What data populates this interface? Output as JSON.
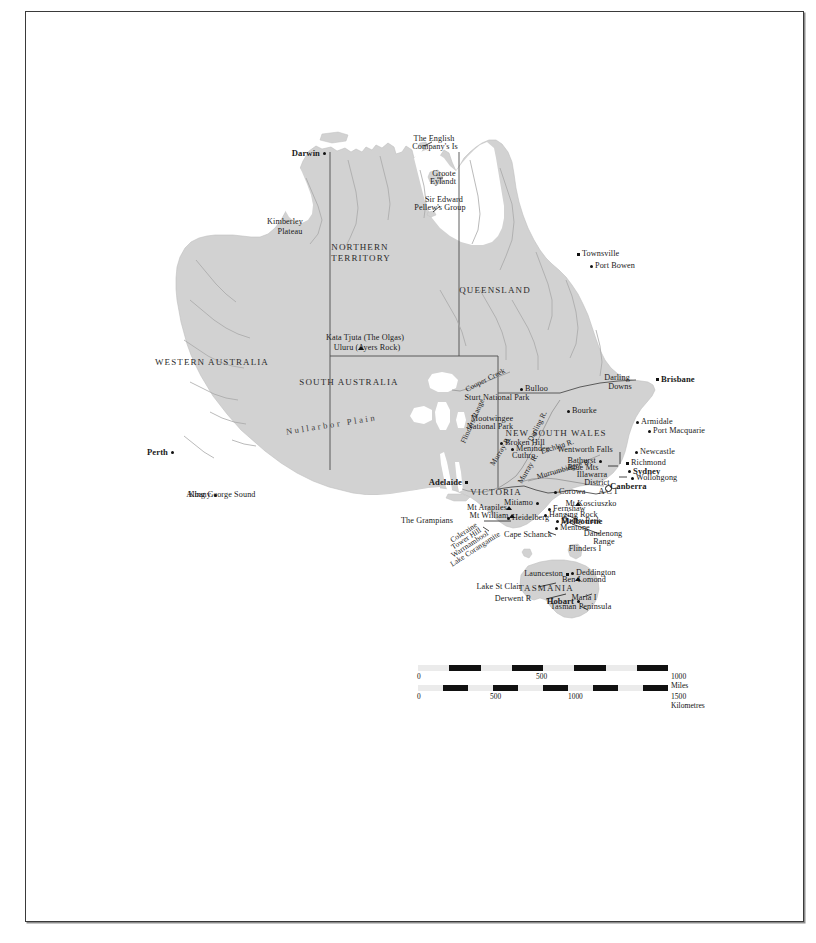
{
  "map": {
    "title": "Australia",
    "land_color": "#d2d2d2",
    "border_color": "#8a8a8a",
    "river_color": "#a8a8a8",
    "frame_color": "#3a3a3a",
    "background": "#ffffff"
  },
  "states": [
    {
      "name": "WESTERN AUSTRALIA",
      "x": 212,
      "y": 363
    },
    {
      "name": "NORTHERN",
      "x": 360,
      "y": 248
    },
    {
      "name": "TERRITORY",
      "x": 361,
      "y": 259
    },
    {
      "name": "QUEENSLAND",
      "x": 495,
      "y": 291
    },
    {
      "name": "SOUTH AUSTRALIA",
      "x": 349,
      "y": 383
    },
    {
      "name": "NEW SOUTH WALES",
      "x": 556,
      "y": 434
    },
    {
      "name": "VICTORIA",
      "x": 496,
      "y": 493
    },
    {
      "name": "TASMANIA",
      "x": 546,
      "y": 589
    },
    {
      "name": "ACT",
      "x": 609,
      "y": 492
    }
  ],
  "cities": [
    {
      "name": "Darwin",
      "x": 324,
      "y": 153,
      "bold": true,
      "marker": "dot",
      "anchor": "right"
    },
    {
      "name": "Townsville",
      "x": 578,
      "y": 254,
      "bold": false,
      "marker": "sq",
      "anchor": "left"
    },
    {
      "name": "Port Bowen",
      "x": 591,
      "y": 266,
      "bold": false,
      "marker": "dot",
      "anchor": "left"
    },
    {
      "name": "Brisbane",
      "x": 657,
      "y": 379,
      "bold": true,
      "marker": "sq",
      "anchor": "left"
    },
    {
      "name": "Bulloo",
      "x": 521,
      "y": 389,
      "bold": false,
      "marker": "dot",
      "anchor": "left"
    },
    {
      "name": "Bourke",
      "x": 568,
      "y": 411,
      "bold": false,
      "marker": "dot",
      "anchor": "left"
    },
    {
      "name": "Armidale",
      "x": 637,
      "y": 422,
      "bold": false,
      "marker": "dot",
      "anchor": "left"
    },
    {
      "name": "Port Macquarie",
      "x": 649,
      "y": 431,
      "bold": false,
      "marker": "dot",
      "anchor": "left"
    },
    {
      "name": "Newcastle",
      "x": 636,
      "y": 452,
      "bold": false,
      "marker": "dot",
      "anchor": "left"
    },
    {
      "name": "Richmond",
      "x": 627,
      "y": 463,
      "bold": false,
      "marker": "sq",
      "anchor": "left"
    },
    {
      "name": "Sydney",
      "x": 629,
      "y": 471,
      "bold": true,
      "marker": "dot",
      "anchor": "left"
    },
    {
      "name": "Wollongong",
      "x": 632,
      "y": 478,
      "bold": false,
      "marker": "dot",
      "anchor": "left"
    },
    {
      "name": "Canberra",
      "x": 606,
      "y": 486,
      "bold": true,
      "marker": "circ",
      "anchor": "left"
    },
    {
      "name": "Broken Hill",
      "x": 501,
      "y": 443,
      "bold": false,
      "marker": "dot",
      "anchor": "left"
    },
    {
      "name": "Menindee",
      "x": 512,
      "y": 449,
      "bold": false,
      "marker": "dot",
      "anchor": "left"
    },
    {
      "name": "Cuthro",
      "x": 508,
      "y": 456,
      "bold": false,
      "marker": "none",
      "anchor": "left"
    },
    {
      "name": "Adelaide",
      "x": 466,
      "y": 482,
      "bold": true,
      "marker": "sq",
      "anchor": "right"
    },
    {
      "name": "Perth",
      "x": 172,
      "y": 452,
      "bold": true,
      "marker": "dot",
      "anchor": "right"
    },
    {
      "name": "Albany",
      "x": 215,
      "y": 495,
      "bold": false,
      "marker": "dot",
      "anchor": "right"
    },
    {
      "name": "Melbourne",
      "x": 557,
      "y": 521,
      "bold": true,
      "marker": "dot",
      "anchor": "left"
    },
    {
      "name": "Mentone",
      "x": 556,
      "y": 528,
      "bold": false,
      "marker": "dot",
      "anchor": "left"
    },
    {
      "name": "Heidelberg",
      "x": 508,
      "y": 518,
      "bold": false,
      "marker": "dot",
      "anchor": "left"
    },
    {
      "name": "Mitiamo",
      "x": 537,
      "y": 503,
      "bold": false,
      "marker": "dot",
      "anchor": "right"
    },
    {
      "name": "Corowa",
      "x": 555,
      "y": 492,
      "bold": false,
      "marker": "dot",
      "anchor": "left"
    },
    {
      "name": "Fernshaw",
      "x": 549,
      "y": 509,
      "bold": false,
      "marker": "dot",
      "anchor": "left"
    },
    {
      "name": "Hanging Rock",
      "x": 545,
      "y": 515,
      "bold": false,
      "marker": "dot",
      "anchor": "left"
    },
    {
      "name": "Bathurst",
      "x": 600,
      "y": 461,
      "bold": false,
      "marker": "dot",
      "anchor": "right"
    },
    {
      "name": "Launceston",
      "x": 567,
      "y": 574,
      "bold": false,
      "marker": "sq",
      "anchor": "right"
    },
    {
      "name": "Deddington",
      "x": 572,
      "y": 573,
      "bold": false,
      "marker": "dot",
      "anchor": "left"
    },
    {
      "name": "Hobart",
      "x": 578,
      "y": 601,
      "bold": true,
      "marker": "dot",
      "anchor": "right"
    }
  ],
  "features": [
    {
      "name": "The English",
      "x": 434,
      "y": 139
    },
    {
      "name": "Company's Is",
      "x": 435,
      "y": 147
    },
    {
      "name": "Groote",
      "x": 444,
      "y": 174
    },
    {
      "name": "Eylandt",
      "x": 443,
      "y": 182
    },
    {
      "name": "Sir Edward",
      "x": 444,
      "y": 200
    },
    {
      "name": "Pellew's Group",
      "x": 440,
      "y": 208
    },
    {
      "name": "Kimberley",
      "x": 285,
      "y": 222
    },
    {
      "name": "Plateau",
      "x": 290,
      "y": 232
    },
    {
      "name": "Kata Tjuta (The Olgas)",
      "x": 365,
      "y": 338
    },
    {
      "name": "Uluru (Ayers Rock)",
      "x": 367,
      "y": 348
    },
    {
      "name": "Sturt National Park",
      "x": 497,
      "y": 398
    },
    {
      "name": "Mootwingee",
      "x": 492,
      "y": 419
    },
    {
      "name": "National Park",
      "x": 490,
      "y": 427
    },
    {
      "name": "Darling",
      "x": 617,
      "y": 378
    },
    {
      "name": "Downs",
      "x": 620,
      "y": 387
    },
    {
      "name": "Wentworth Falls",
      "x": 585,
      "y": 450
    },
    {
      "name": "Blue Mts",
      "x": 583,
      "y": 468
    },
    {
      "name": "Illawarra",
      "x": 592,
      "y": 475
    },
    {
      "name": "District",
      "x": 597,
      "y": 483
    },
    {
      "name": "Mt Kosciuszko",
      "x": 591,
      "y": 504
    },
    {
      "name": "Mt Arapiles",
      "x": 487,
      "y": 508
    },
    {
      "name": "Mt William",
      "x": 489,
      "y": 516
    },
    {
      "name": "The Grampians",
      "x": 427,
      "y": 521
    },
    {
      "name": "Cape Schanck",
      "x": 528,
      "y": 535
    },
    {
      "name": "Dusky Park",
      "x": 581,
      "y": 521
    },
    {
      "name": "Dandenong",
      "x": 603,
      "y": 534
    },
    {
      "name": "Range",
      "x": 604,
      "y": 542
    },
    {
      "name": "Flinders I",
      "x": 585,
      "y": 549
    },
    {
      "name": "Ben Lomond",
      "x": 584,
      "y": 580
    },
    {
      "name": "Lake St Clair",
      "x": 499,
      "y": 587
    },
    {
      "name": "Derwent R",
      "x": 513,
      "y": 599
    },
    {
      "name": "Maria I",
      "x": 584,
      "y": 598
    },
    {
      "name": "Tasman Peninsula",
      "x": 581,
      "y": 607
    },
    {
      "name": "King George Sound",
      "x": 222,
      "y": 495
    }
  ],
  "rotated_labels": [
    {
      "name": "Nullarbor Plain",
      "x": 286,
      "y": 432,
      "rot": -9
    },
    {
      "name": "Flinders Range",
      "x": 463,
      "y": 443,
      "rot": -66
    },
    {
      "name": "Cooper Creek",
      "x": 466,
      "y": 390,
      "rot": -27
    },
    {
      "name": "Darling R.",
      "x": 530,
      "y": 441,
      "rot": -63
    },
    {
      "name": "Lachlan R.",
      "x": 541,
      "y": 452,
      "rot": -18
    },
    {
      "name": "Murrumbidgee R.",
      "x": 537,
      "y": 477,
      "rot": -16
    },
    {
      "name": "Murray R.",
      "x": 520,
      "y": 483,
      "rot": -60
    },
    {
      "name": "Murray R.",
      "x": 492,
      "y": 465,
      "rot": -58
    },
    {
      "name": "Coleraine",
      "x": 451,
      "y": 541,
      "rot": -33
    },
    {
      "name": "Tower Hill",
      "x": 452,
      "y": 548,
      "rot": -33
    },
    {
      "name": "Warrnambool",
      "x": 452,
      "y": 556,
      "rot": -33
    },
    {
      "name": "Lake Corangamite",
      "x": 451,
      "y": 565,
      "rot": -33
    }
  ],
  "scale": {
    "miles": {
      "labels": [
        "0",
        "500",
        "1000 Miles"
      ],
      "tick_positions": [
        0,
        125,
        250
      ],
      "segments": 8
    },
    "kilometres": {
      "labels": [
        "0",
        "500",
        "1000",
        "1500 Kilometres"
      ],
      "tick_positions": [
        0,
        79,
        158,
        237
      ],
      "segments": 10
    }
  }
}
